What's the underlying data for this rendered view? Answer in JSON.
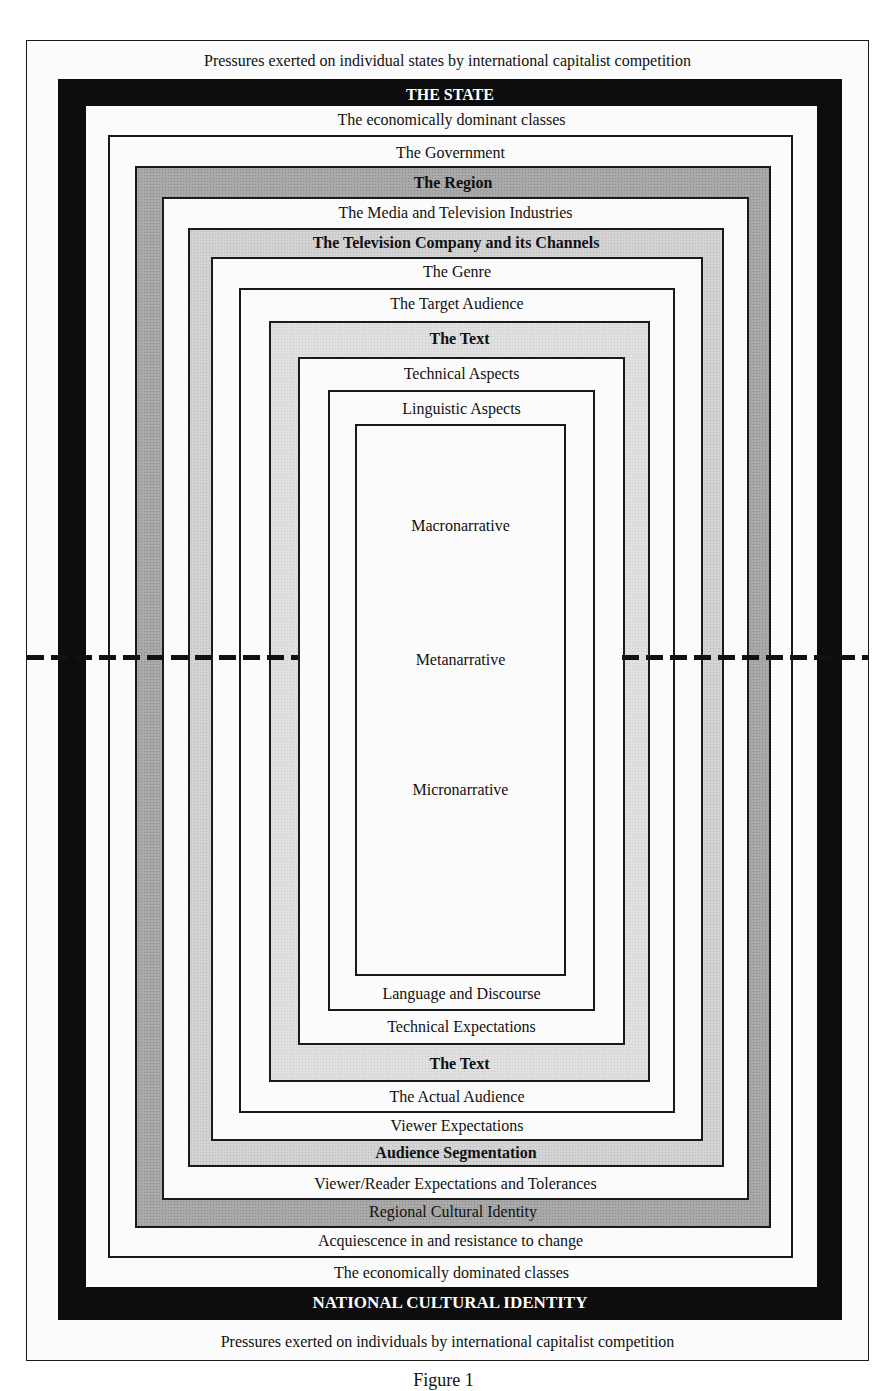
{
  "figure": {
    "caption": "Figure 1",
    "outer": {
      "top_label": "Pressures exerted on individual states by international capitalist competition",
      "bottom_label": "Pressures exerted on individuals by international capitalist competition"
    },
    "state": {
      "top_label": "THE STATE",
      "bottom_label": "NATIONAL CULTURAL IDENTITY",
      "fill": "#0d0d0d"
    },
    "classes": {
      "top_label": "The economically dominant classes",
      "bottom_label": "The economically dominated classes"
    },
    "government": {
      "top_label": "The Government",
      "bottom_label": "Acquiescence in and resistance to change"
    },
    "region": {
      "top_label": "The Region",
      "bottom_label": "Regional Cultural Identity",
      "fill": "#a9a9a9"
    },
    "media": {
      "top_label": "The Media and Television Industries",
      "bottom_label": "Viewer/Reader Expectations and Tolerances"
    },
    "tv_company": {
      "top_label": "The Television Company and its Channels",
      "bottom_label": "Audience Segmentation",
      "fill": "#d3d3d3"
    },
    "genre": {
      "top_label": "The Genre",
      "bottom_label": "Viewer Expectations"
    },
    "target_audience": {
      "top_label": "The Target Audience",
      "bottom_label": "The Actual Audience"
    },
    "text": {
      "top_label": "The Text",
      "bottom_label": "The Text",
      "fill": "#e0e0e0"
    },
    "technical": {
      "top_label": "Technical Aspects",
      "bottom_label": "Technical Expectations"
    },
    "linguistic": {
      "top_label": "Linguistic Aspects",
      "bottom_label": "Language and Discourse"
    },
    "core": {
      "labels": [
        "Macronarrative",
        "Metanarrative",
        "Micronarrative"
      ]
    },
    "divider": {
      "style": "dashed",
      "meaning": "upper half / lower half split"
    }
  }
}
